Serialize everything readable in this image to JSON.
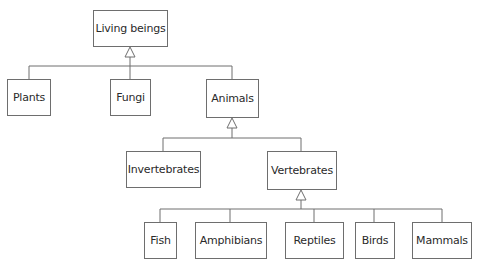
{
  "diagram": {
    "type": "class-hierarchy",
    "colors": {
      "line": "#6e6e6e",
      "text": "#2a2a2a",
      "background": "#ffffff"
    },
    "nodes": {
      "living_beings": "Living beings",
      "plants": "Plants",
      "fungi": "Fungi",
      "animals": "Animals",
      "invertebrates": "Invertebrates",
      "vertebrates": "Vertebrates",
      "fish": "Fish",
      "amphibians": "Amphibians",
      "reptiles": "Reptiles",
      "birds": "Birds",
      "mammals": "Mammals"
    },
    "edges": [
      {
        "from": "Plants",
        "to": "Living beings",
        "kind": "generalization"
      },
      {
        "from": "Fungi",
        "to": "Living beings",
        "kind": "generalization"
      },
      {
        "from": "Animals",
        "to": "Living beings",
        "kind": "generalization"
      },
      {
        "from": "Invertebrates",
        "to": "Animals",
        "kind": "generalization"
      },
      {
        "from": "Vertebrates",
        "to": "Animals",
        "kind": "generalization"
      },
      {
        "from": "Fish",
        "to": "Vertebrates",
        "kind": "generalization"
      },
      {
        "from": "Amphibians",
        "to": "Vertebrates",
        "kind": "generalization"
      },
      {
        "from": "Reptiles",
        "to": "Vertebrates",
        "kind": "generalization"
      },
      {
        "from": "Birds",
        "to": "Vertebrates",
        "kind": "generalization"
      },
      {
        "from": "Mammals",
        "to": "Vertebrates",
        "kind": "generalization"
      }
    ]
  }
}
